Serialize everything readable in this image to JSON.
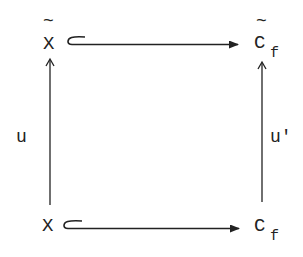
{
  "diagram": {
    "type": "commutative-square",
    "nodes": {
      "top_left": {
        "symbol": "X",
        "accent": "~"
      },
      "top_right": {
        "symbol": "C",
        "subscript": "f",
        "accent": "~"
      },
      "bottom_left": {
        "symbol": "X"
      },
      "bottom_right": {
        "symbol": "C",
        "subscript": "f"
      }
    },
    "edges": {
      "top": {
        "from": "top_left",
        "to": "top_right",
        "style": "hook-inclusion"
      },
      "bottom": {
        "from": "bottom_left",
        "to": "bottom_right",
        "style": "hook-inclusion"
      },
      "left": {
        "from": "bottom_left",
        "to": "top_left",
        "label": "u"
      },
      "right": {
        "from": "bottom_right",
        "to": "top_right",
        "label": "u'"
      }
    },
    "colors": {
      "ink": "#222222",
      "background": "#ffffff"
    }
  }
}
